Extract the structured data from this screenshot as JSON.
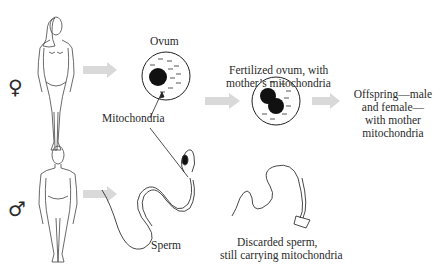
{
  "diagram": {
    "labels": {
      "ovum": "Ovum",
      "mitochondria": "Mitochondria",
      "fertilized_line1": "Fertilized ovum, with",
      "fertilized_line2": "mother’s mitochondria",
      "offspring_line1": "Offspring—male",
      "offspring_line2": "and female—",
      "offspring_line3": "with mother",
      "offspring_line4": "mitochondria",
      "sperm": "Sperm",
      "discarded_line1": "Discarded sperm,",
      "discarded_line2": "still carrying mitochondria"
    },
    "symbols": {
      "female": "♀",
      "male": "♂"
    },
    "colors": {
      "arrow": "#d9d9d9",
      "line": "#333333",
      "nucleus": "#111111"
    }
  }
}
